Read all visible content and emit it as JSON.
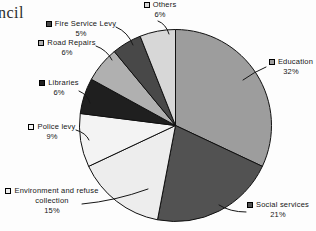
{
  "page": {
    "fragment_text": "ncil"
  },
  "chart_data": {
    "type": "pie",
    "title": "",
    "unit": "%",
    "start_angle_deg": 0,
    "direction": "clockwise",
    "legend_position": "callout-labels",
    "slices": [
      {
        "label": "Education",
        "value": 32,
        "pct_label": "32%",
        "color": "#9d9d9d"
      },
      {
        "label": "Social services",
        "value": 21,
        "pct_label": "21%",
        "color": "#525252"
      },
      {
        "label": "Environment and refuse collection",
        "value": 15,
        "pct_label": "15%",
        "color": "#ededed"
      },
      {
        "label": "Police levy",
        "value": 9,
        "pct_label": "9%",
        "color": "#f3f3f3"
      },
      {
        "label": "Libraries",
        "value": 6,
        "pct_label": "6%",
        "color": "#1f1f1f"
      },
      {
        "label": "Road Repairs",
        "value": 6,
        "pct_label": "6%",
        "color": "#b0b0b0"
      },
      {
        "label": "Fire Service Levy",
        "value": 5,
        "pct_label": "5%",
        "color": "#484848"
      },
      {
        "label": "Others",
        "value": 6,
        "pct_label": "6%",
        "color": "#d7d7d7"
      }
    ]
  }
}
